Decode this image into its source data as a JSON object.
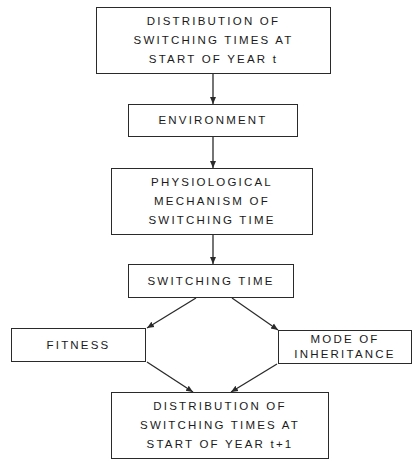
{
  "diagram": {
    "type": "flowchart",
    "nodes": {
      "start_distribution": {
        "lines": [
          "DISTRIBUTION OF",
          "SWITCHING TIMES AT",
          "START OF YEAR t"
        ]
      },
      "environment": {
        "lines": [
          "ENVIRONMENT"
        ]
      },
      "physiological_mechanism": {
        "lines": [
          "PHYSIOLOGICAL",
          "MECHANISM OF",
          "SWITCHING TIME"
        ]
      },
      "switching_time": {
        "lines": [
          "SWITCHING TIME"
        ]
      },
      "fitness": {
        "lines": [
          "FITNESS"
        ]
      },
      "mode_of_inheritance": {
        "lines": [
          "MODE OF",
          "INHERITANCE"
        ]
      },
      "end_distribution": {
        "lines": [
          "DISTRIBUTION OF",
          "SWITCHING TIMES AT",
          "START OF YEAR t+1"
        ]
      }
    },
    "edges": [
      {
        "from": "start_distribution",
        "to": "environment"
      },
      {
        "from": "environment",
        "to": "physiological_mechanism"
      },
      {
        "from": "physiological_mechanism",
        "to": "switching_time"
      },
      {
        "from": "switching_time",
        "to": "fitness"
      },
      {
        "from": "switching_time",
        "to": "mode_of_inheritance"
      },
      {
        "from": "fitness",
        "to": "end_distribution"
      },
      {
        "from": "mode_of_inheritance",
        "to": "end_distribution"
      }
    ],
    "colors": {
      "stroke": "#2a2a2a",
      "background": "#ffffff",
      "text": "#1a1a1a"
    }
  }
}
